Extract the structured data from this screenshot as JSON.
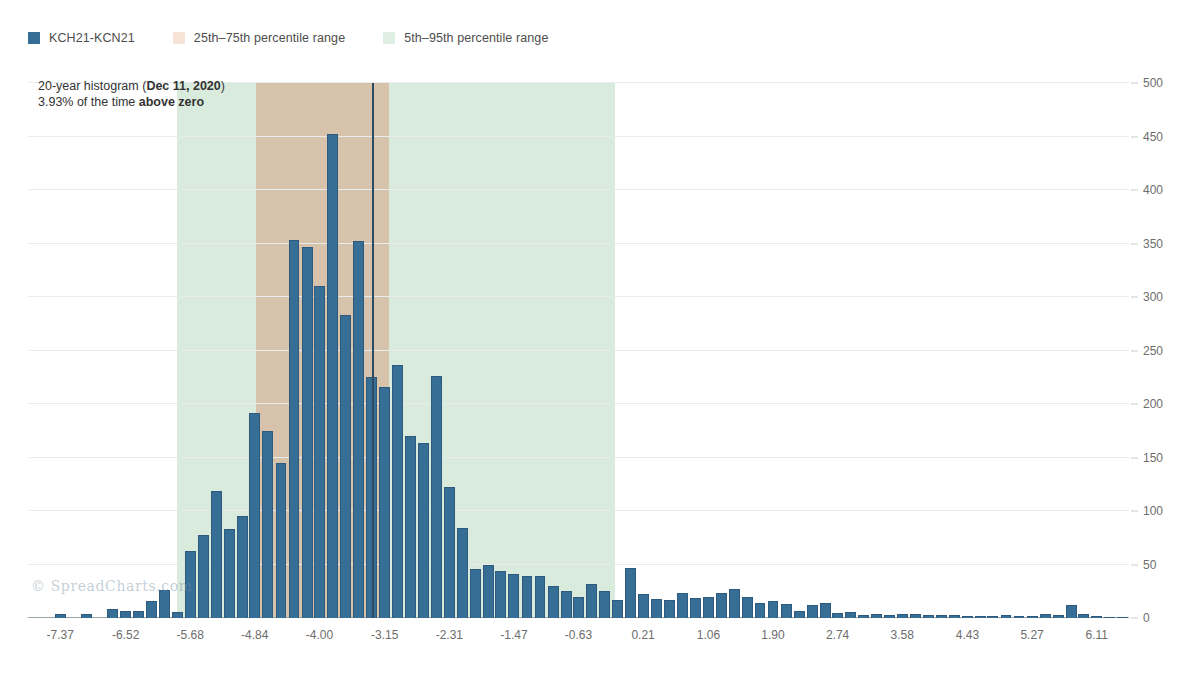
{
  "legend": {
    "items": [
      {
        "label": "KCH21-KCN21",
        "color": "#376e96",
        "name": "series-kch21-kcn21"
      },
      {
        "label": "25th–75th percentile range",
        "color": "#f7e2d8",
        "name": "band-25-75"
      },
      {
        "label": "5th–95th percentile range",
        "color": "#dff0e3",
        "name": "band-5-95"
      }
    ]
  },
  "annotation": {
    "line1_prefix": "20-year histogram (",
    "line1_bold": "Dec 11, 2020",
    "line1_suffix": ")",
    "line2_prefix": "3.93% of the time ",
    "line2_bold": "above zero"
  },
  "watermark": "© SpreadCharts.com",
  "chart_data": {
    "type": "bar",
    "title": "20-year histogram (Dec 11, 2020)",
    "subtitle": "3.93% of the time above zero",
    "xlabel": "",
    "ylabel": "",
    "grid": true,
    "legend_position": "top-left",
    "series_name": "KCH21-KCN21",
    "bar_color": "#376e96",
    "xlim": [
      -7.79,
      6.53
    ],
    "ylim": [
      0,
      500
    ],
    "y_ticks": [
      0,
      50,
      100,
      150,
      200,
      250,
      300,
      350,
      400,
      450,
      500
    ],
    "x_ticks": [
      -7.37,
      -6.52,
      -5.68,
      -4.84,
      -4.0,
      -3.15,
      -2.31,
      -1.47,
      -0.63,
      0.21,
      1.06,
      1.9,
      2.74,
      3.58,
      4.43,
      5.27,
      6.11
    ],
    "x_tick_labels": [
      "-7.37",
      "-6.52",
      "-5.68",
      "-4.84",
      "-4.00",
      "-3.15",
      "-2.31",
      "-1.47",
      "-0.63",
      "0.21",
      "1.06",
      "1.90",
      "2.74",
      "3.58",
      "4.43",
      "5.27",
      "6.11"
    ],
    "bin_width": 0.169,
    "bin_centers": [
      -7.37,
      -7.2,
      -7.03,
      -6.86,
      -6.69,
      -6.52,
      -6.35,
      -6.18,
      -6.01,
      -5.84,
      -5.68,
      -5.51,
      -5.34,
      -5.17,
      -5.0,
      -4.84,
      -4.67,
      -4.5,
      -4.33,
      -4.16,
      -4.0,
      -3.83,
      -3.66,
      -3.49,
      -3.32,
      -3.15,
      -2.98,
      -2.82,
      -2.65,
      -2.48,
      -2.31,
      -2.14,
      -1.97,
      -1.8,
      -1.64,
      -1.47,
      -1.3,
      -1.13,
      -0.96,
      -0.79,
      -0.63,
      -0.46,
      -0.29,
      -0.12,
      0.05,
      0.21,
      0.38,
      0.55,
      0.72,
      0.89,
      1.06,
      1.23,
      1.4,
      1.57,
      1.73,
      1.9,
      2.07,
      2.24,
      2.41,
      2.58,
      2.74,
      2.91,
      3.08,
      3.25,
      3.42,
      3.58,
      3.75,
      3.92,
      4.09,
      4.26,
      4.43,
      4.6,
      4.76,
      4.93,
      5.1,
      5.27,
      5.44,
      5.61,
      5.78,
      5.94,
      6.11,
      6.28,
      6.45
    ],
    "values": [
      4,
      0,
      4,
      0,
      8,
      7,
      7,
      16,
      26,
      6,
      63,
      78,
      119,
      83,
      95,
      192,
      175,
      145,
      353,
      347,
      310,
      452,
      283,
      352,
      225,
      216,
      236,
      170,
      164,
      226,
      122,
      84,
      46,
      50,
      44,
      41,
      39,
      39,
      30,
      25,
      20,
      32,
      25,
      17,
      47,
      22,
      18,
      17,
      23,
      19,
      20,
      23,
      27,
      20,
      14,
      16,
      13,
      7,
      12,
      14,
      5,
      6,
      3,
      4,
      3,
      4,
      4,
      3,
      3,
      3,
      2,
      2,
      2,
      3,
      2,
      2,
      4,
      3,
      12,
      4,
      2,
      1,
      1
    ],
    "marker_value": -3.31,
    "band_25_75": [
      -4.82,
      -3.09
    ],
    "band_5_95": [
      -5.85,
      -0.16
    ]
  }
}
